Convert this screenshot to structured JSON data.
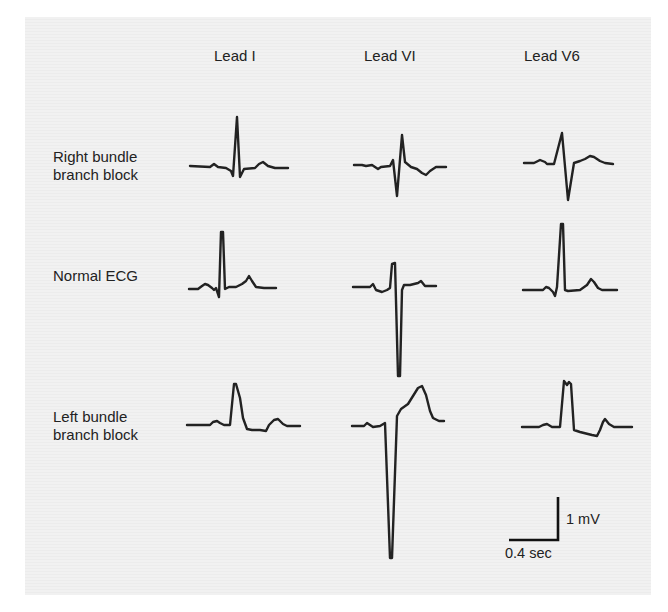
{
  "figure": {
    "column_headers": [
      {
        "label": "Lead I",
        "x": 214,
        "y": 47
      },
      {
        "label": "Lead VI",
        "x": 364,
        "y": 47
      },
      {
        "label": "Lead V6",
        "x": 524,
        "y": 47
      }
    ],
    "row_labels": [
      {
        "label": "Right bundle\nbranch block",
        "x": 53,
        "y": 148
      },
      {
        "label": "Normal ECG",
        "x": 53,
        "y": 267
      },
      {
        "label": "Left bundle\nbranch block",
        "x": 53,
        "y": 408
      }
    ],
    "trace_color": "#222222",
    "traces": [
      {
        "row": "Right bundle branch block",
        "lead": "Lead I",
        "d": "M190,166 L210,167 L214,164 L218,167 L226,168 L231,171 L233,176 L237,117 L240,177 L244,169 L255,168 L259,164 L263,162 L268,166 L275,168 L288,168"
      },
      {
        "row": "Right bundle branch block",
        "lead": "Lead VI",
        "d": "M354,165 L362,165 L366,166 L372,165 L375,167 L378,169 L381,167 L390,166 L393,160 L397,196 L402,135 L405,162 L411,167 L417,169 L422,173 L426,175 L430,171 L436,167 L446,167"
      },
      {
        "row": "Right bundle branch block",
        "lead": "Lead V6",
        "d": "M524,163 L534,163 L540,160 L545,162 L547,164 L554,164 L562,133 L568,200 L574,163 L580,161 L585,159 L590,156 L594,157 L600,161 L605,163 L613,164"
      },
      {
        "row": "Normal ECG",
        "lead": "Normal ECG Lead I",
        "d": "M189,289 L198,289 L202,286 L205,284 L208,285 L212,288 L214,290 L216,288 L219,297 L221,232 L223,232 L225,289 L229,287 L236,287 L242,284 L246,281 L249,276 L252,281 L256,287 L264,288 L276,288"
      },
      {
        "row": "Normal ECG",
        "lead": "Lead VI",
        "d": "M353,287 L370,287 L373,284 L376,290 L382,292 L387,290 L390,288 L392,264 L395,263 L398,376 L400,376 L402,290 L404,285 L410,285 L414,284 L418,283 L421,281 L425,286 L436,286"
      },
      {
        "row": "Normal ECG",
        "lead": "Lead V6",
        "d": "M523,290 L543,290 L546,287 L549,288 L553,292 L555,296 L557,287 L561,224 L563,224 L565,290 L568,291 L580,290 L587,285 L591,279 L594,282 L598,288 L602,290 L617,290"
      },
      {
        "row": "Left bundle branch block",
        "lead": "Lead I",
        "d": "M187,425 L210,425 L213,422 L217,421 L220,423 L224,425 L230,425 L234,384 L236,384 L240,398 L243,418 L247,429 L252,430 L260,430 L266,431 L269,425 L274,420 L278,419 L283,424 L287,426 L300,426"
      },
      {
        "row": "Left bundle branch block",
        "lead": "Lead VI",
        "d": "M352,426 L364,426 L367,423 L370,425 L373,427 L380,426 L385,423 L390,558 L392,558 L397,416 L401,409 L408,404 L413,396 L418,388 L422,386 L426,395 L430,411 L433,418 L439,421 L444,421"
      },
      {
        "row": "Left bundle branch block",
        "lead": "Lead V6",
        "d": "M522,427 L539,427 L543,425 L547,424 L552,427 L560,427 L564,381 L567,385 L569,382 L571,384 L574,430 L580,432 L592,435 L597,436 L600,430 L603,422 L605,419 L609,424 L614,427 L632,427"
      }
    ],
    "scale_bar": {
      "voltage_label": "1 mV",
      "time_label": "0.4 sec",
      "d": "M509,540 L558,540 L558,497"
    }
  }
}
